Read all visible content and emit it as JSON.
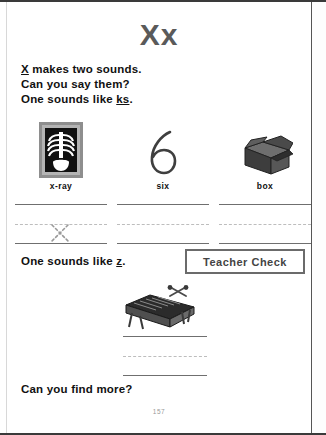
{
  "page": {
    "title": "Xx",
    "page_number": "157",
    "footer_question": "Can you find more?"
  },
  "intro": {
    "line1_pre": "X",
    "line1_post": " makes two sounds.",
    "line2": "Can you say them?",
    "line3_pre": "One sounds like ",
    "line3_sound": "ks",
    "line3_post": "."
  },
  "picture_columns": [
    {
      "caption": "x-ray",
      "icon": "xray-film-icon"
    },
    {
      "caption": "six",
      "icon": "numeral-six-icon"
    },
    {
      "caption": "box",
      "icon": "open-box-icon"
    }
  ],
  "practice": {
    "trace_letter": "x",
    "second_sound_pre": "One sounds like ",
    "second_sound": "z",
    "second_sound_post": ".",
    "teacher_check_label": "Teacher Check"
  },
  "xylophone_section": {
    "icon": "xylophone-icon"
  },
  "colors": {
    "title": "#5a5a5a",
    "text": "#111111",
    "rule": "#6f6f6f",
    "dashed": "#bdbdbd",
    "border": "#6b6b6b"
  }
}
